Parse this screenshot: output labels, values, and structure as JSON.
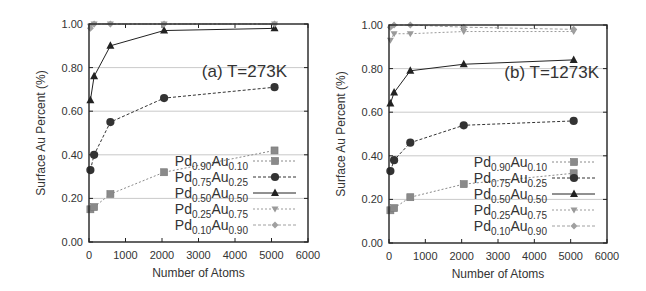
{
  "chart_data": [
    {
      "type": "line",
      "title": "(a) T=273K",
      "xlabel": "Number of Atoms",
      "ylabel": "Surface Au Percent (%)",
      "xlim": [
        0,
        6000
      ],
      "ylim": [
        0.0,
        1.0
      ],
      "xticks": [
        "0",
        "1000",
        "2000",
        "3000",
        "4000",
        "5000",
        "6000"
      ],
      "yticks": [
        "0.00",
        "0.20",
        "0.40",
        "0.60",
        "0.80",
        "1.00"
      ],
      "grid": "horizontal",
      "legend_position": "lower right",
      "series": [
        {
          "name": "Pd0.90Au0.10",
          "sub1": "0.90",
          "sub2": "0.10",
          "marker": "square",
          "x": [
            38,
            140,
            586,
            2057,
            5083
          ],
          "y": [
            0.15,
            0.16,
            0.22,
            0.32,
            0.42
          ]
        },
        {
          "name": "Pd0.75Au0.25",
          "sub1": "0.75",
          "sub2": "0.25",
          "marker": "circle",
          "x": [
            38,
            140,
            586,
            2057,
            5083
          ],
          "y": [
            0.33,
            0.4,
            0.55,
            0.66,
            0.71
          ]
        },
        {
          "name": "Pd0.50Au0.50",
          "sub1": "0.50",
          "sub2": "0.50",
          "marker": "triangle",
          "x": [
            38,
            140,
            586,
            2057,
            5083
          ],
          "y": [
            0.65,
            0.76,
            0.9,
            0.97,
            0.98
          ]
        },
        {
          "name": "Pd0.25Au0.75",
          "sub1": "0.25",
          "sub2": "0.75",
          "marker": "triangle-down",
          "x": [
            38,
            140,
            586,
            2057,
            5083
          ],
          "y": [
            0.99,
            1.0,
            1.0,
            1.0,
            1.0
          ]
        },
        {
          "name": "Pd0.10Au0.90",
          "sub1": "0.10",
          "sub2": "0.90",
          "marker": "diamond",
          "x": [
            38,
            140,
            586,
            2057,
            5083
          ],
          "y": [
            0.98,
            1.0,
            1.0,
            1.0,
            1.0
          ]
        }
      ]
    },
    {
      "type": "line",
      "title": "(b) T=1273K",
      "xlabel": "Number of Atoms",
      "ylabel": "Surface Au Percent (%)",
      "xlim": [
        0,
        6000
      ],
      "ylim": [
        0.0,
        1.0
      ],
      "xticks": [
        "0",
        "1000",
        "2000",
        "3000",
        "4000",
        "5000",
        "6000"
      ],
      "yticks": [
        "0.00",
        "0.20",
        "0.40",
        "0.60",
        "0.80",
        "1.00"
      ],
      "grid": "horizontal",
      "legend_position": "lower right",
      "series": [
        {
          "name": "Pd0.90Au0.10",
          "sub1": "0.90",
          "sub2": "0.10",
          "marker": "square",
          "x": [
            38,
            140,
            586,
            2057,
            5083
          ],
          "y": [
            0.15,
            0.16,
            0.21,
            0.27,
            0.32
          ]
        },
        {
          "name": "Pd0.75Au0.25",
          "sub1": "0.75",
          "sub2": "0.25",
          "marker": "circle",
          "x": [
            38,
            140,
            586,
            2057,
            5083
          ],
          "y": [
            0.33,
            0.38,
            0.46,
            0.54,
            0.56
          ]
        },
        {
          "name": "Pd0.50Au0.50",
          "sub1": "0.50",
          "sub2": "0.50",
          "marker": "triangle",
          "x": [
            38,
            140,
            586,
            2057,
            5083
          ],
          "y": [
            0.64,
            0.69,
            0.79,
            0.82,
            0.84
          ]
        },
        {
          "name": "Pd0.25Au0.75",
          "sub1": "0.25",
          "sub2": "0.75",
          "marker": "triangle-down",
          "x": [
            38,
            140,
            586,
            2057,
            5083
          ],
          "y": [
            0.93,
            0.96,
            0.96,
            0.97,
            0.97
          ]
        },
        {
          "name": "Pd0.10Au0.90",
          "sub1": "0.10",
          "sub2": "0.90",
          "marker": "diamond",
          "x": [
            38,
            140,
            586,
            2057,
            5083
          ],
          "y": [
            0.99,
            1.0,
            1.0,
            0.99,
            0.98
          ]
        }
      ]
    }
  ],
  "style": {
    "series_colors": [
      "#8a8a8a",
      "#333333",
      "#222222",
      "#9a9a9a",
      "#a0a0a0"
    ],
    "series_dash": [
      "2,2",
      "3,2",
      "",
      "2,2",
      "3,2"
    ]
  }
}
